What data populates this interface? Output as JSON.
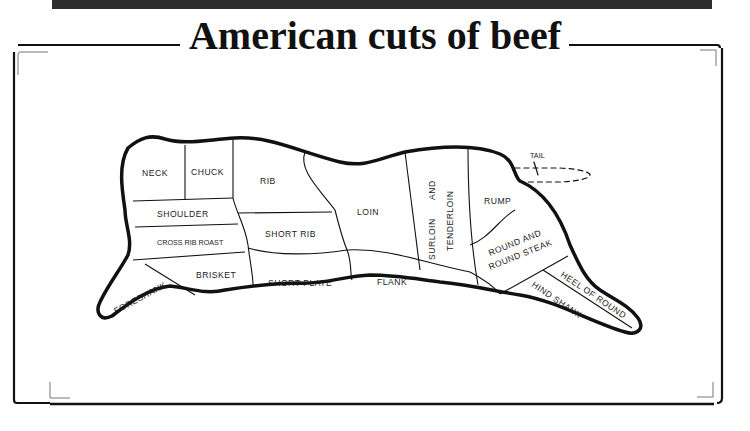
{
  "title": "American cuts of beef",
  "colors": {
    "ink": "#111111",
    "topbar": "#2e2e2e",
    "background": "#ffffff"
  },
  "cuts": {
    "neck": "NECK",
    "chuck": "CHUCK",
    "rib": "RIB",
    "shoulder": "SHOULDER",
    "cross_rib_roast": "CROSS RIB ROAST",
    "short_rib": "SHORT RIB",
    "brisket": "BRISKET",
    "foreshank": "FORESHANK",
    "short_plate": "SHORT PLATE",
    "loin": "LOIN",
    "flank": "FLANK",
    "surloin": "SURLOIN",
    "and": "AND",
    "tenderloin": "TENDERLOIN",
    "rump": "RUMP",
    "round_line1": "ROUND AND",
    "round_line2": "ROUND STEAK",
    "heel_of_round": "HEEL OF ROUND",
    "hind_shank": "HIND SHANK",
    "tail": "TAIL"
  }
}
